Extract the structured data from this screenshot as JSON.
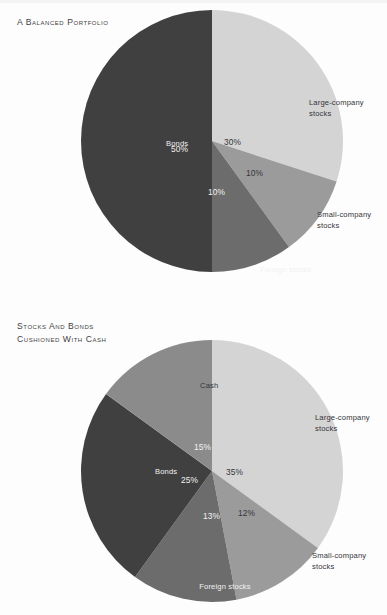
{
  "page": {
    "background": "#fdfdfd",
    "text_dark": "#35353a",
    "text_light": "#f2f2f2"
  },
  "palette": {
    "large_company": "#d4d4d4",
    "small_company": "#9b9b9b",
    "foreign": "#6c6c6c",
    "bonds": "#404040",
    "cash": "#8b8b8b"
  },
  "charts": [
    {
      "id": "balanced-portfolio",
      "title": "A Balanced Portfolio",
      "slices": [
        {
          "label": "Large-company stocks",
          "pct_text": "30%",
          "value": 30,
          "color": "#d4d4d4",
          "label_tone": "dark"
        },
        {
          "label": "Small-company stocks",
          "pct_text": "10%",
          "value": 10,
          "color": "#9b9b9b",
          "label_tone": "dark"
        },
        {
          "label": "Foreign stocks",
          "pct_text": "10%",
          "value": 10,
          "color": "#6c6c6c",
          "label_tone": "light"
        },
        {
          "label": "Bonds",
          "pct_text": "50%",
          "value": 50,
          "color": "#404040",
          "label_tone": "light"
        }
      ]
    },
    {
      "id": "stocks-bonds-cash",
      "title": "Stocks and Bonds\nCushioned with Cash",
      "slices": [
        {
          "label": "Large-company stocks",
          "pct_text": "35%",
          "value": 35,
          "color": "#d4d4d4",
          "label_tone": "dark"
        },
        {
          "label": "Small-company stocks",
          "pct_text": "12%",
          "value": 12,
          "color": "#9b9b9b",
          "label_tone": "dark"
        },
        {
          "label": "Foreign stocks",
          "pct_text": "13%",
          "value": 13,
          "color": "#6c6c6c",
          "label_tone": "light"
        },
        {
          "label": "Bonds",
          "pct_text": "25%",
          "value": 25,
          "color": "#404040",
          "label_tone": "light"
        },
        {
          "label": "Cash",
          "pct_text": "15%",
          "value": 15,
          "color": "#8b8b8b",
          "label_tone": "dark"
        }
      ]
    }
  ],
  "chart_data": [
    {
      "type": "pie",
      "title": "A Balanced Portfolio",
      "xlabel": "",
      "ylabel": "",
      "legend_position": "inside-slices",
      "grid": false,
      "start_angle_deg": 0,
      "direction": "clockwise",
      "categories": [
        "Large-company stocks",
        "Small-company stocks",
        "Foreign stocks",
        "Bonds"
      ],
      "values": [
        30,
        10,
        10,
        50
      ],
      "data_labels": [
        "30%",
        "10%",
        "10%",
        "50%"
      ],
      "colors": [
        "#d4d4d4",
        "#9b9b9b",
        "#6c6c6c",
        "#404040"
      ],
      "total": 100
    },
    {
      "type": "pie",
      "title": "Stocks and Bonds Cushioned with Cash",
      "xlabel": "",
      "ylabel": "",
      "legend_position": "inside-slices",
      "grid": false,
      "start_angle_deg": 0,
      "direction": "clockwise",
      "categories": [
        "Large-company stocks",
        "Small-company stocks",
        "Foreign stocks",
        "Bonds",
        "Cash"
      ],
      "values": [
        35,
        12,
        13,
        25,
        15
      ],
      "data_labels": [
        "35%",
        "12%",
        "13%",
        "25%",
        "15%"
      ],
      "colors": [
        "#d4d4d4",
        "#9b9b9b",
        "#6c6c6c",
        "#404040",
        "#8b8b8b"
      ],
      "total": 100
    }
  ],
  "label_layout": {
    "chart1": [
      {
        "name": "large-company",
        "lines": [
          "Large-company",
          "stocks"
        ],
        "x": 97,
        "y": 95,
        "anchor": "start",
        "tone": "dark"
      },
      {
        "name": "small-company",
        "lines": [
          "Small-company",
          "stocks"
        ],
        "x": 105,
        "y": 207,
        "anchor": "start",
        "tone": "dark"
      },
      {
        "name": "foreign",
        "lines": [
          "Foreign stocks"
        ],
        "x": 48,
        "y": 262,
        "anchor": "start",
        "tone": "light"
      },
      {
        "name": "bonds",
        "lines": [
          "Bonds"
        ],
        "x": -46,
        "y": 136,
        "anchor": "start",
        "tone": "light"
      }
    ],
    "chart1_pct": [
      {
        "name": "pct-30",
        "text": "30%",
        "x": 12,
        "y": 135,
        "tone": "dark"
      },
      {
        "name": "pct-10-small",
        "text": "10%",
        "x": 34,
        "y": 166,
        "tone": "dark"
      },
      {
        "name": "pct-10-foreign",
        "text": "10%",
        "x": -4,
        "y": 185,
        "tone": "light"
      },
      {
        "name": "pct-50",
        "text": "50%",
        "x": -41,
        "y": 142,
        "tone": "light"
      }
    ],
    "chart2": [
      {
        "name": "large-company",
        "lines": [
          "Large-company",
          "stocks"
        ],
        "x": 103,
        "y": 80,
        "anchor": "start",
        "tone": "dark"
      },
      {
        "name": "small-company",
        "lines": [
          "Small-company",
          "stocks"
        ],
        "x": 100,
        "y": 218,
        "anchor": "start",
        "tone": "dark"
      },
      {
        "name": "foreign",
        "lines": [
          "Foreign stocks"
        ],
        "x": 13,
        "y": 249,
        "anchor": "middle",
        "tone": "light"
      },
      {
        "name": "bonds",
        "lines": [
          "Bonds"
        ],
        "x": -57,
        "y": 134,
        "anchor": "start",
        "tone": "light"
      },
      {
        "name": "cash",
        "lines": [
          "Cash"
        ],
        "x": -12,
        "y": 48,
        "anchor": "start",
        "tone": "dark"
      }
    ],
    "chart2_pct": [
      {
        "name": "pct-35",
        "text": "35%",
        "x": 14,
        "y": 135,
        "tone": "dark"
      },
      {
        "name": "pct-12",
        "text": "12%",
        "x": 26,
        "y": 176,
        "tone": "dark"
      },
      {
        "name": "pct-13",
        "text": "13%",
        "x": -9,
        "y": 179,
        "tone": "light"
      },
      {
        "name": "pct-25",
        "text": "25%",
        "x": -31,
        "y": 143,
        "tone": "light"
      },
      {
        "name": "pct-15",
        "text": "15%",
        "x": -18,
        "y": 110,
        "tone": "light"
      }
    ]
  }
}
